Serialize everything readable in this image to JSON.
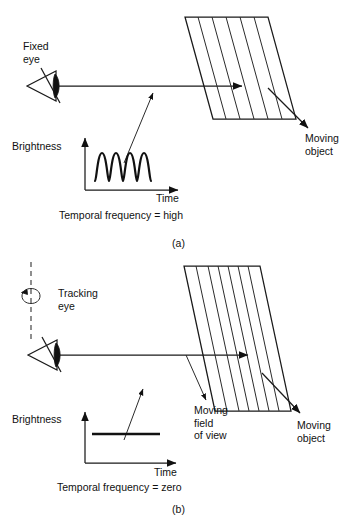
{
  "figure": {
    "panels": [
      {
        "id": "a",
        "tag": "(a)",
        "eye_label_line1": "Fixed",
        "eye_label_line2": "eye",
        "object_label_line1": "Moving",
        "object_label_line2": "object",
        "y_axis_label": "Brightness",
        "x_axis_label": "Time",
        "caption": "Temporal frequency = high",
        "waveform_type": "square-wave",
        "waveform_cycles": 4,
        "grating_bars": 6
      },
      {
        "id": "b",
        "tag": "(b)",
        "eye_label_line1": "Tracking",
        "eye_label_line2": "eye",
        "fov_label_line1": "Moving",
        "fov_label_line2": "field",
        "fov_label_line3": "of view",
        "object_label_line1": "Moving",
        "object_label_line2": "object",
        "y_axis_label": "Brightness",
        "x_axis_label": "Time",
        "caption": "Temporal frequency = zero",
        "waveform_type": "flat-line",
        "waveform_cycles": 0,
        "grating_bars": 8
      }
    ],
    "bottom_caption": "",
    "colors": {
      "ink": "#111111",
      "line": "#1a1a1a",
      "dashed": "#333333",
      "background": "#ffffff",
      "faded_text": "#8d8d8d"
    }
  }
}
